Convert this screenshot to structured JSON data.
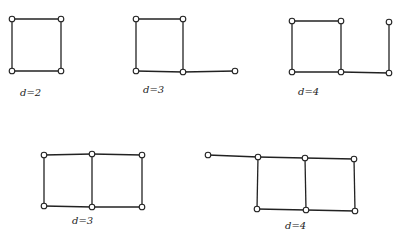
{
  "diagram": {
    "type": "graph-examples",
    "graphs": [
      {
        "id": "g1",
        "label": "d=2",
        "label_pos": [
          20,
          96
        ],
        "nodes": [
          [
            12,
            19
          ],
          [
            61,
            19
          ],
          [
            12,
            71
          ],
          [
            61,
            71
          ]
        ],
        "edges": [
          [
            0,
            1
          ],
          [
            1,
            3
          ],
          [
            3,
            2
          ],
          [
            2,
            0
          ]
        ]
      },
      {
        "id": "g2",
        "label": "d=3",
        "label_pos": [
          143,
          93
        ],
        "nodes": [
          [
            136,
            19
          ],
          [
            183,
            19
          ],
          [
            136,
            71
          ],
          [
            183,
            72
          ],
          [
            235,
            71
          ]
        ],
        "edges": [
          [
            0,
            1
          ],
          [
            1,
            3
          ],
          [
            3,
            2
          ],
          [
            2,
            0
          ],
          [
            3,
            4
          ]
        ]
      },
      {
        "id": "g3",
        "label": "d=4",
        "label_pos": [
          298,
          95
        ],
        "nodes": [
          [
            292,
            21
          ],
          [
            341,
            21
          ],
          [
            292,
            72
          ],
          [
            341,
            72
          ],
          [
            389,
            73
          ],
          [
            389,
            22
          ]
        ],
        "edges": [
          [
            0,
            1
          ],
          [
            1,
            3
          ],
          [
            3,
            2
          ],
          [
            2,
            0
          ],
          [
            3,
            4
          ],
          [
            4,
            5
          ]
        ]
      },
      {
        "id": "g4",
        "label": "d=3",
        "label_pos": [
          72,
          224
        ],
        "nodes": [
          [
            44,
            155
          ],
          [
            92,
            154
          ],
          [
            142,
            155
          ],
          [
            44,
            206
          ],
          [
            92,
            207
          ],
          [
            142,
            207
          ]
        ],
        "edges": [
          [
            0,
            1
          ],
          [
            1,
            2
          ],
          [
            2,
            5
          ],
          [
            5,
            4
          ],
          [
            4,
            3
          ],
          [
            3,
            0
          ],
          [
            1,
            4
          ]
        ]
      },
      {
        "id": "g5",
        "label": "d=4",
        "label_pos": [
          285,
          229
        ],
        "nodes": [
          [
            208,
            155
          ],
          [
            258,
            157
          ],
          [
            305,
            158
          ],
          [
            354,
            159
          ],
          [
            257,
            209
          ],
          [
            306,
            210
          ],
          [
            355,
            211
          ]
        ],
        "edges": [
          [
            0,
            1
          ],
          [
            1,
            2
          ],
          [
            2,
            3
          ],
          [
            3,
            6
          ],
          [
            6,
            5
          ],
          [
            5,
            4
          ],
          [
            4,
            1
          ],
          [
            2,
            5
          ]
        ]
      }
    ]
  }
}
